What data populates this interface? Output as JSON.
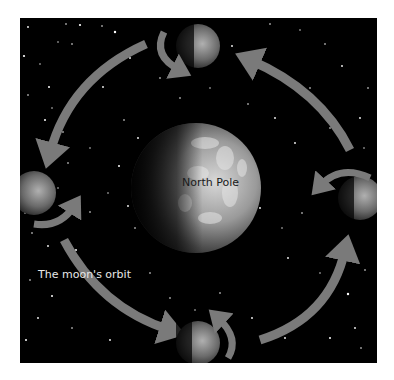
{
  "diagram": {
    "labels": {
      "center": "North Pole",
      "orbit": "The moon's orbit"
    },
    "nodes": [
      {
        "id": "earth",
        "type": "planet",
        "position": "center"
      },
      {
        "id": "moon-top",
        "type": "moon",
        "position": "top",
        "rotation_arrow": "counterclockwise"
      },
      {
        "id": "moon-left",
        "type": "moon",
        "position": "left",
        "rotation_arrow": "counterclockwise"
      },
      {
        "id": "moon-bottom",
        "type": "moon",
        "position": "bottom",
        "rotation_arrow": "counterclockwise"
      },
      {
        "id": "moon-right",
        "type": "moon",
        "position": "right",
        "rotation_arrow": "counterclockwise"
      }
    ],
    "edges": [
      {
        "from": "moon-top",
        "to": "moon-left",
        "type": "orbit-arrow"
      },
      {
        "from": "moon-left",
        "to": "moon-bottom",
        "type": "orbit-arrow"
      },
      {
        "from": "moon-bottom",
        "to": "moon-right",
        "type": "orbit-arrow"
      },
      {
        "from": "moon-right",
        "to": "moon-top",
        "type": "orbit-arrow"
      }
    ],
    "colors": {
      "background": "#000000",
      "arrow": "#7a7a7a",
      "earth_light": "#c8c8c8",
      "earth_dark": "#2a2a2a",
      "label": "#e8e8e8"
    }
  }
}
